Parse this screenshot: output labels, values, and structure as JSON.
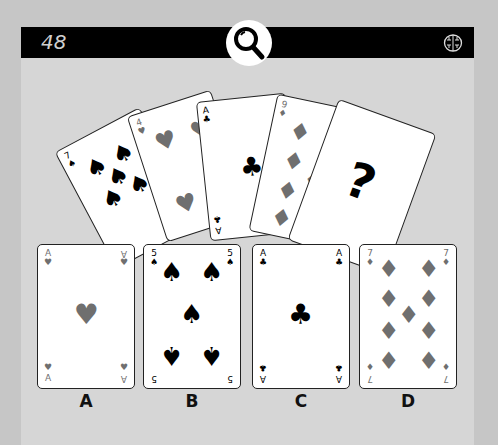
{
  "header": {
    "level_number": "48",
    "hint_icon": "magnifier-icon",
    "brain_icon": "brain-icon"
  },
  "puzzle": {
    "fan_cards": [
      {
        "rank": "7",
        "suit": "spades"
      },
      {
        "rank": "4",
        "suit": "hearts"
      },
      {
        "rank": "A",
        "suit": "clubs"
      },
      {
        "rank": "9",
        "suit": "diamonds"
      },
      {
        "rank": "?",
        "suit": "unknown",
        "face": "?"
      }
    ],
    "options": [
      {
        "label": "A",
        "rank": "A",
        "suit": "hearts"
      },
      {
        "label": "B",
        "rank": "5",
        "suit": "spades"
      },
      {
        "label": "C",
        "rank": "A",
        "suit": "clubs"
      },
      {
        "label": "D",
        "rank": "7",
        "suit": "diamonds"
      }
    ]
  },
  "colors": {
    "background": "#c6c6c6",
    "panel": "#d6d6d6",
    "topbar": "#000000",
    "red_suit": "#6f6f6f"
  }
}
